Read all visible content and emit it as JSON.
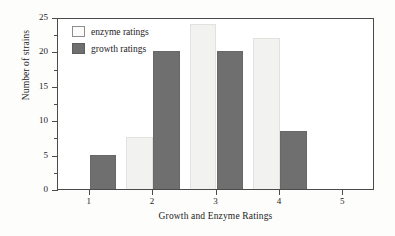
{
  "chart_data": {
    "type": "bar",
    "title": "",
    "xlabel": "Growth and Enzyme Ratings",
    "ylabel": "Number of strains",
    "categories": [
      "1",
      "2",
      "3",
      "4",
      "5"
    ],
    "series": [
      {
        "name": "enzyme ratings",
        "values": [
          0,
          7.5,
          24,
          22,
          0
        ],
        "color": "#f2f2f0"
      },
      {
        "name": "growth ratings",
        "values": [
          5,
          20,
          20,
          8.5,
          0
        ],
        "color": "#6f6f6f"
      }
    ],
    "ylim": [
      0,
      25
    ],
    "ytick_labels": [
      "0",
      "5",
      "10",
      "15",
      "20",
      "25"
    ],
    "ytick_values": [
      0,
      5,
      10,
      15,
      20,
      25
    ],
    "yminor_values": [
      2.5,
      7.5,
      12.5,
      17.5,
      22.5
    ],
    "grid": false,
    "legend_position": "upper left"
  },
  "legend": {
    "items": [
      {
        "label": "enzyme ratings"
      },
      {
        "label": "growth ratings"
      }
    ]
  }
}
